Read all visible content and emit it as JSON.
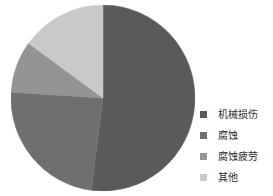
{
  "chart_data": {
    "type": "pie",
    "title": "",
    "subtitle": "",
    "xlabel": "",
    "ylabel": "",
    "grid": false,
    "legend_position": "right",
    "start_angle_deg": 0,
    "direction": "clockwise",
    "categories": [
      "机械损伤",
      "腐蚀",
      "腐蚀疲劳",
      "其他"
    ],
    "values": [
      52,
      24,
      9,
      15
    ],
    "units": "percent",
    "slices": [
      {
        "label": "机械损伤",
        "value": 52,
        "color": "#5a5a5a",
        "start_deg": 0,
        "end_deg": 187.2
      },
      {
        "label": "腐蚀",
        "value": 24,
        "color": "#6f6f6f",
        "start_deg": 187.2,
        "end_deg": 273.6
      },
      {
        "label": "腐蚀疲劳",
        "value": 9,
        "color": "#949494",
        "start_deg": 273.6,
        "end_deg": 306.0
      },
      {
        "label": "其他",
        "value": 15,
        "color": "#c9c9c9",
        "start_deg": 306.0,
        "end_deg": 360.0
      }
    ]
  },
  "legend": {
    "items": [
      {
        "label": "机械损伤",
        "color": "#5a5a5a"
      },
      {
        "label": "腐蚀",
        "color": "#6f6f6f"
      },
      {
        "label": "腐蚀疲劳",
        "color": "#949494"
      },
      {
        "label": "其他",
        "color": "#c9c9c9"
      }
    ]
  },
  "colors": {
    "background": "#ffffff",
    "text": "#2b2b2b",
    "slice_1": "#5a5a5a",
    "slice_2": "#6f6f6f",
    "slice_3": "#949494",
    "slice_4": "#c9c9c9"
  }
}
